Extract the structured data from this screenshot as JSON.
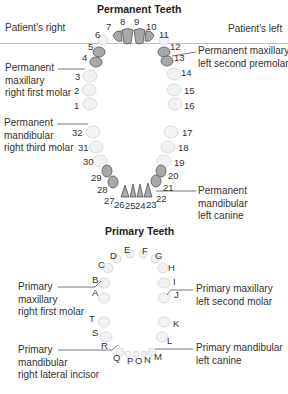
{
  "permanent": {
    "title": "Permanent Teeth",
    "side_right": "Patient's right",
    "side_left": "Patient's left",
    "numbers": {
      "n1": "1",
      "n2": "2",
      "n3": "3",
      "n4": "4",
      "n5": "5",
      "n6": "6",
      "n7": "7",
      "n8": "8",
      "n9": "9",
      "n10": "10",
      "n11": "11",
      "n12": "12",
      "n13": "13",
      "n14": "14",
      "n15": "15",
      "n16": "16",
      "n17": "17",
      "n18": "18",
      "n19": "19",
      "n20": "20",
      "n21": "21",
      "n22": "22",
      "n23": "23",
      "n24": "24",
      "n25": "25",
      "n26": "26",
      "n27": "27",
      "n28": "28",
      "n29": "29",
      "n30": "30",
      "n31": "31",
      "n32": "32"
    },
    "callouts": {
      "max_left_second_premolar": "Permanent maxillary\nleft second premolar",
      "max_right_first_molar": "Permanent\nmaxillary\nright first molar",
      "mand_right_third_molar": "Permanent\nmandibular\nright third molar",
      "mand_left_canine": "Permanent\nmandibular\nleft canine"
    },
    "highlighted_teeth": [
      4,
      5,
      7,
      8,
      9,
      10,
      12,
      13,
      20,
      21,
      23,
      24,
      25,
      26,
      28,
      29
    ]
  },
  "primary": {
    "title": "Primary Teeth",
    "letters": {
      "A": "A",
      "B": "B",
      "C": "C",
      "D": "D",
      "E": "E",
      "F": "F",
      "G": "G",
      "H": "H",
      "I": "I",
      "J": "J",
      "K": "K",
      "L": "L",
      "M": "M",
      "N": "N",
      "O": "O",
      "P": "P",
      "Q": "Q",
      "R": "R",
      "S": "S",
      "T": "T"
    },
    "callouts": {
      "max_right_first_molar": "Primary\nmaxillary\nright first molar",
      "max_left_second_molar": "Primary maxillary\nleft second molar",
      "mand_left_canine": "Primary mandibular\nleft canine",
      "mand_right_lateral_incisor": "Primary\nmandibular\nright lateral incisor"
    }
  },
  "colors": {
    "highlight_fill": "#a8a8a8",
    "faint_tooth": "#e4e4e4",
    "divider": "#bdbdbd"
  }
}
